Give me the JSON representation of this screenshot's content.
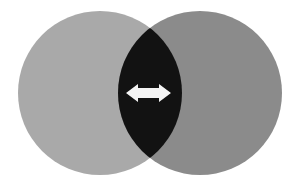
{
  "diagram": {
    "type": "venn",
    "background": "#ffffff",
    "circles": [
      {
        "id": "left",
        "cx": 100,
        "cy": 93,
        "r": 82,
        "fill": "#a9a9a9"
      },
      {
        "id": "right",
        "cx": 200,
        "cy": 93,
        "r": 82,
        "fill": "#8b8b8b"
      }
    ],
    "intersection": {
      "fill": "#121212"
    },
    "arrow": {
      "icon": "double-headed-arrow",
      "fill": "#f4f4f4",
      "x1": 126,
      "x2": 171,
      "cy": 93,
      "shaft_half": 5,
      "head_half": 9,
      "head_len": 12
    }
  }
}
